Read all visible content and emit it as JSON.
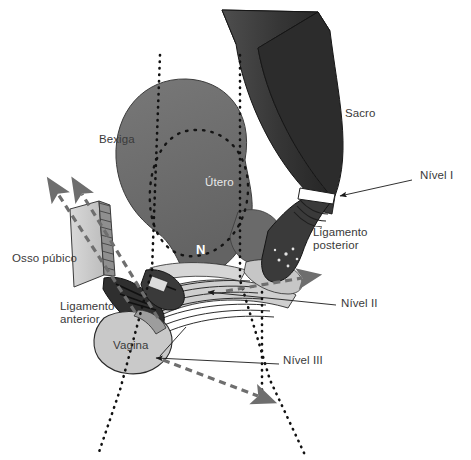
{
  "figure": {
    "language": "pt-BR",
    "background_color": "#ffffff"
  },
  "palette": {
    "sacrum_dark": "#2f2f2f",
    "sacrum_mid": "#4a4a4a",
    "organ_gray": "#6e6e6e",
    "organ_gray_dark": "#5c5c5c",
    "light_gray": "#c2c2c2",
    "mid_gray": "#9a9a9a",
    "pale_gray": "#d8d8d8",
    "outline": "#1a1a1a",
    "label_text": "#3a3a3a",
    "white": "#ffffff",
    "dashed_arrow": "#6b6b6b",
    "dotted_line": "#111111"
  },
  "labels": {
    "sacro": {
      "text": "Sacro",
      "x": 345,
      "y": 113
    },
    "bexiga": {
      "text": "Bexiga",
      "x": 99,
      "y": 139
    },
    "utero": {
      "text": "Útero",
      "x": 205,
      "y": 182
    },
    "nivel_i": {
      "text": "Nível I",
      "x": 420,
      "y": 175
    },
    "ligamento_posterior": {
      "text": "Ligamento\nposterior",
      "x": 313,
      "y": 232
    },
    "osso_publico": {
      "text": "Osso púbico",
      "x": 12,
      "y": 258
    },
    "nivel_ii": {
      "text": "Nível II",
      "x": 341,
      "y": 303
    },
    "ligamento_anterior": {
      "text": "Ligamento\nanterior",
      "x": 60,
      "y": 306
    },
    "vagina": {
      "text": "Vagina",
      "x": 113,
      "y": 345
    },
    "nivel_iii": {
      "text": "Nível III",
      "x": 283,
      "y": 360
    },
    "n_marker": {
      "text": "N",
      "x": 196,
      "y": 250
    }
  },
  "leaders": [
    {
      "name": "nivel-i-leader",
      "from": [
        412,
        183
      ],
      "to": [
        335,
        196
      ],
      "arrow": true
    },
    {
      "name": "nivel-ii-leader",
      "from": [
        336,
        305
      ],
      "to": [
        203,
        289
      ],
      "arrow": true
    },
    {
      "name": "nivel-iii-leader",
      "from": [
        279,
        364
      ],
      "to": [
        151,
        357
      ],
      "arrow": true
    }
  ],
  "dashed_arrows": [
    {
      "name": "arrow-anterior-upper",
      "path": "M 135 310 L 55 191",
      "head": [
        52,
        186
      ]
    },
    {
      "name": "arrow-anterior-lower",
      "path": "M 156 316 L 79 191",
      "head": [
        76,
        186
      ]
    },
    {
      "name": "arrow-posterior",
      "path": "M 228 291 L 305 277",
      "head": [
        312,
        276
      ]
    },
    {
      "name": "arrow-inferior",
      "path": "M 163 360 L 262 397",
      "head": [
        268,
        399
      ]
    }
  ],
  "dotted_vertical_lines": [
    {
      "name": "dotted-axis-left",
      "x1": 160,
      "y1": 55,
      "x2": 98,
      "y2": 455
    },
    {
      "name": "dotted-axis-right",
      "x1": 240,
      "y1": 55,
      "x2": 305,
      "y2": 455
    },
    {
      "name": "dotted-axis-drop",
      "x1": 262,
      "y1": 292,
      "x2": 262,
      "y2": 392
    }
  ],
  "structures": [
    {
      "name": "sacrum",
      "label": "Sacro",
      "tone": "dark"
    },
    {
      "name": "bladder-uterus-body",
      "label": "Bexiga / Útero",
      "tone": "medium"
    },
    {
      "name": "uterus-outline-dotted",
      "label": "Útero (contorno pontilhado)",
      "tone": "dotted"
    },
    {
      "name": "pubic-bone",
      "label": "Osso púbico",
      "tone": "light"
    },
    {
      "name": "vagina",
      "label": "Vagina",
      "tone": "light"
    },
    {
      "name": "levator-muscle-striations",
      "label": "Musculatura estriada",
      "tone": "hatched"
    },
    {
      "name": "posterior-ligament",
      "label": "Ligamento posterior",
      "tone": "dark"
    },
    {
      "name": "anterior-ligament",
      "label": "Ligamento anterior",
      "tone": "dark"
    }
  ]
}
